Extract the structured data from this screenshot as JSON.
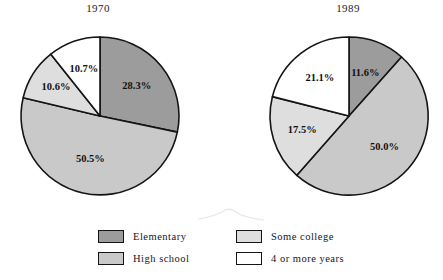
{
  "chart_data": [
    {
      "type": "pie",
      "title": "1970",
      "categories": [
        "Elementary",
        "High school",
        "Some college",
        "4 or more years"
      ],
      "values": [
        28.3,
        50.5,
        10.6,
        10.7
      ],
      "labels": [
        "28.3%",
        "50.5%",
        "10.6%",
        "10.7%"
      ],
      "unit": "percent",
      "start_angle_deg": 0,
      "direction": "clockwise",
      "legend": "bottom",
      "grid": false,
      "colors": [
        "#9c9c9c",
        "#c9c9c9",
        "#dedede",
        "#ffffff"
      ]
    },
    {
      "type": "pie",
      "title": "1989",
      "categories": [
        "Elementary",
        "High school",
        "Some college",
        "4 or more years"
      ],
      "values": [
        11.6,
        50.0,
        17.5,
        21.1
      ],
      "labels": [
        "11.6%",
        "50.0%",
        "17.5%",
        "21.1%"
      ],
      "unit": "percent",
      "start_angle_deg": 0,
      "direction": "clockwise",
      "legend": "bottom",
      "grid": false,
      "colors": [
        "#9c9c9c",
        "#c9c9c9",
        "#dedede",
        "#ffffff"
      ]
    }
  ],
  "legend": {
    "items": [
      {
        "label": "Elementary",
        "color": "#9c9c9c"
      },
      {
        "label": "Some college",
        "color": "#dedede"
      },
      {
        "label": "High school",
        "color": "#c9c9c9"
      },
      {
        "label": "4 or more years",
        "color": "#ffffff"
      }
    ]
  }
}
